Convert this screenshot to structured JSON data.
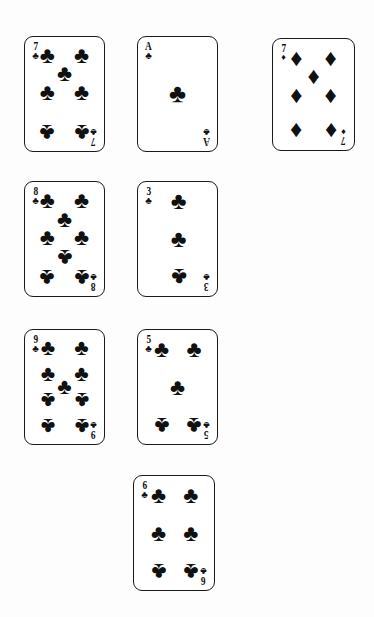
{
  "scene": {
    "title": "Playing cards layout",
    "background_color": "#fdfdfd",
    "card_face_color": "#ffffff",
    "ink_color": "#111111",
    "suit_glyphs": {
      "clubs": "♣",
      "diamonds": "♦"
    }
  },
  "cards": [
    {
      "id": "card-7-of-clubs",
      "rank": "7",
      "suit": "clubs",
      "suit_glyph": "♣",
      "suit_name": "clubs",
      "label": "7 of Clubs",
      "pip_count": 7,
      "x": 24,
      "y": 36,
      "w": 81,
      "h": 116,
      "pip_size": 23,
      "pips": [
        {
          "x": 22,
          "y": 11,
          "flip": false
        },
        {
          "x": 78,
          "y": 11,
          "flip": false
        },
        {
          "x": 50,
          "y": 29,
          "flip": false
        },
        {
          "x": 22,
          "y": 48,
          "flip": false
        },
        {
          "x": 78,
          "y": 48,
          "flip": false
        },
        {
          "x": 22,
          "y": 88,
          "flip": true
        },
        {
          "x": 78,
          "y": 88,
          "flip": true
        }
      ]
    },
    {
      "id": "card-ace-of-clubs",
      "rank": "A",
      "suit": "clubs",
      "suit_glyph": "♣",
      "suit_name": "clubs",
      "label": "Ace of Clubs",
      "pip_count": 1,
      "x": 137,
      "y": 36,
      "w": 81,
      "h": 116,
      "pip_size": 26,
      "pips": [
        {
          "x": 50,
          "y": 50,
          "flip": false
        }
      ]
    },
    {
      "id": "card-7-of-diamonds",
      "rank": "7",
      "suit": "diamonds",
      "suit_glyph": "♦",
      "suit_name": "diamonds",
      "label": "7 of Diamonds",
      "pip_count": 7,
      "x": 272,
      "y": 38,
      "w": 83,
      "h": 113,
      "pip_size": 24,
      "pips": [
        {
          "x": 23,
          "y": 12,
          "flip": false
        },
        {
          "x": 77,
          "y": 12,
          "flip": false
        },
        {
          "x": 50,
          "y": 31,
          "flip": false
        },
        {
          "x": 23,
          "y": 50,
          "flip": false
        },
        {
          "x": 77,
          "y": 50,
          "flip": false
        },
        {
          "x": 23,
          "y": 88,
          "flip": true
        },
        {
          "x": 77,
          "y": 88,
          "flip": true
        }
      ]
    },
    {
      "id": "card-8-of-clubs",
      "rank": "8",
      "suit": "clubs",
      "suit_glyph": "♣",
      "suit_name": "clubs",
      "label": "8 of Clubs",
      "pip_count": 8,
      "x": 24,
      "y": 181,
      "w": 81,
      "h": 116,
      "pip_size": 23,
      "pips": [
        {
          "x": 22,
          "y": 11,
          "flip": false
        },
        {
          "x": 78,
          "y": 11,
          "flip": false
        },
        {
          "x": 50,
          "y": 30,
          "flip": false
        },
        {
          "x": 22,
          "y": 48,
          "flip": false
        },
        {
          "x": 78,
          "y": 48,
          "flip": false
        },
        {
          "x": 50,
          "y": 68,
          "flip": true
        },
        {
          "x": 22,
          "y": 88,
          "flip": true
        },
        {
          "x": 78,
          "y": 88,
          "flip": true
        }
      ]
    },
    {
      "id": "card-3-of-clubs",
      "rank": "3",
      "suit": "clubs",
      "suit_glyph": "♣",
      "suit_name": "clubs",
      "label": "3 of Clubs",
      "pip_count": 3,
      "x": 137,
      "y": 181,
      "w": 81,
      "h": 116,
      "pip_size": 24,
      "pips": [
        {
          "x": 52,
          "y": 12,
          "flip": false
        },
        {
          "x": 52,
          "y": 50,
          "flip": false
        },
        {
          "x": 52,
          "y": 88,
          "flip": true
        }
      ]
    },
    {
      "id": "card-9-of-clubs",
      "rank": "9",
      "suit": "clubs",
      "suit_glyph": "♣",
      "suit_name": "clubs",
      "label": "9 of Clubs",
      "pip_count": 9,
      "x": 24,
      "y": 329,
      "w": 81,
      "h": 116,
      "pip_size": 22,
      "pips": [
        {
          "x": 23,
          "y": 11,
          "flip": false
        },
        {
          "x": 78,
          "y": 11,
          "flip": false
        },
        {
          "x": 23,
          "y": 37,
          "flip": false
        },
        {
          "x": 78,
          "y": 37,
          "flip": false
        },
        {
          "x": 50,
          "y": 50,
          "flip": false
        },
        {
          "x": 23,
          "y": 63,
          "flip": true
        },
        {
          "x": 78,
          "y": 63,
          "flip": true
        },
        {
          "x": 23,
          "y": 89,
          "flip": true
        },
        {
          "x": 78,
          "y": 89,
          "flip": true
        }
      ]
    },
    {
      "id": "card-5-of-clubs",
      "rank": "5",
      "suit": "clubs",
      "suit_glyph": "♣",
      "suit_name": "clubs",
      "label": "5 of Clubs",
      "pip_count": 5,
      "x": 137,
      "y": 329,
      "w": 81,
      "h": 116,
      "pip_size": 23,
      "pips": [
        {
          "x": 24,
          "y": 12,
          "flip": false
        },
        {
          "x": 77,
          "y": 12,
          "flip": false
        },
        {
          "x": 50,
          "y": 50,
          "flip": false
        },
        {
          "x": 24,
          "y": 88,
          "flip": true
        },
        {
          "x": 77,
          "y": 88,
          "flip": true
        }
      ]
    },
    {
      "id": "card-6-of-clubs",
      "rank": "6",
      "suit": "clubs",
      "suit_glyph": "♣",
      "suit_name": "clubs",
      "label": "6 of Clubs",
      "pip_count": 6,
      "x": 133,
      "y": 475,
      "w": 82,
      "h": 116,
      "pip_size": 23,
      "pips": [
        {
          "x": 25,
          "y": 12,
          "flip": false
        },
        {
          "x": 77,
          "y": 12,
          "flip": false
        },
        {
          "x": 25,
          "y": 50,
          "flip": false
        },
        {
          "x": 77,
          "y": 50,
          "flip": false
        },
        {
          "x": 25,
          "y": 88,
          "flip": true
        },
        {
          "x": 77,
          "y": 88,
          "flip": true
        }
      ]
    }
  ]
}
